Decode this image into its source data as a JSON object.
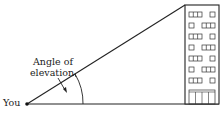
{
  "diagram": {
    "labels": {
      "angle_line1": "Angle of",
      "angle_line2": "elevation",
      "observer": "You"
    },
    "building": {
      "floors": 7,
      "window_rows": [
        [
          "wide",
          "small"
        ],
        [
          "small",
          "wide"
        ],
        [
          "wide",
          "small"
        ],
        [
          "small",
          "wide"
        ],
        [
          "wide",
          "small"
        ],
        [
          "small",
          "wide"
        ],
        [
          "wide",
          "small"
        ]
      ]
    },
    "colors": {
      "line": "#222222",
      "background": "#ffffff"
    }
  }
}
